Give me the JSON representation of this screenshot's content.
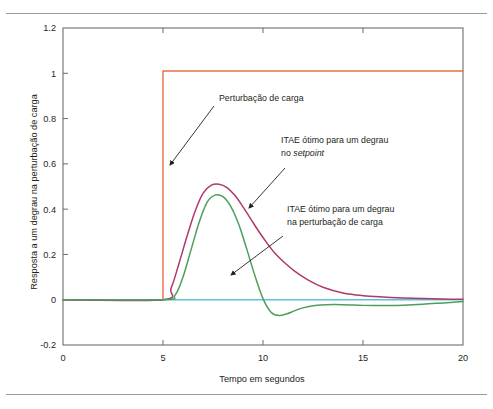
{
  "figure": {
    "clipped_header_text": "",
    "rules": [
      "top-rule",
      "bottom-rule"
    ]
  },
  "chart_data": {
    "type": "line",
    "title": "",
    "xlabel": "Tempo em segundos",
    "ylabel": "Resposta a um degrau na perturbação de carga",
    "xlim": [
      0,
      20
    ],
    "ylim": [
      -0.2,
      1.2
    ],
    "xticks": [
      0,
      5,
      10,
      15,
      20
    ],
    "xticklabels": [
      "0",
      "5",
      "10",
      "15",
      "20"
    ],
    "yticks": [
      -0.2,
      0,
      0.2,
      0.4,
      0.6,
      0.8,
      1,
      1.2
    ],
    "yticklabels": [
      "-0.2",
      "0",
      "0.2",
      "0.4",
      "0.6",
      "0.8",
      "1",
      "1.2"
    ],
    "grid": false,
    "legend": "none",
    "series": [
      {
        "name": "Perturbação de carga",
        "color": "#e8714a",
        "type": "step",
        "x": [
          0,
          5,
          5,
          20
        ],
        "y": [
          0,
          0,
          1.01,
          1.01
        ]
      },
      {
        "name": "Referência (zero)",
        "color": "#59c3d8",
        "type": "line",
        "x": [
          0,
          20
        ],
        "y": [
          0,
          0
        ]
      },
      {
        "name": "ITAE ótimo para um degrau no setpoint",
        "color": "#b0386b",
        "type": "line",
        "x": [
          0,
          5,
          5.4,
          5.8,
          6.2,
          6.6,
          7.0,
          7.4,
          7.8,
          8.2,
          8.6,
          9.0,
          9.4,
          9.8,
          10.2,
          10.6,
          11.0,
          11.6,
          12.2,
          13.0,
          14.0,
          15.0,
          16.0,
          17.0,
          18.0,
          19.0,
          20.0
        ],
        "y": [
          0,
          0,
          0.05,
          0.16,
          0.28,
          0.39,
          0.47,
          0.505,
          0.51,
          0.495,
          0.46,
          0.41,
          0.355,
          0.3,
          0.25,
          0.205,
          0.17,
          0.125,
          0.09,
          0.055,
          0.03,
          0.018,
          0.012,
          0.008,
          0.005,
          0.003,
          0.002
        ]
      },
      {
        "name": "ITAE ótimo para um degrau na perturbação de carga",
        "color": "#4e9e5c",
        "type": "line",
        "x": [
          0,
          5,
          5.6,
          6.0,
          6.4,
          6.8,
          7.2,
          7.6,
          8.0,
          8.4,
          8.8,
          9.2,
          9.6,
          10.0,
          10.4,
          10.8,
          11.2,
          11.6,
          12.0,
          12.6,
          13.2,
          14.0,
          15.0,
          16.0,
          17.0,
          18.0,
          19.0,
          20.0
        ],
        "y": [
          0,
          0,
          0.02,
          0.1,
          0.22,
          0.34,
          0.43,
          0.462,
          0.455,
          0.41,
          0.33,
          0.22,
          0.105,
          0.005,
          -0.055,
          -0.07,
          -0.062,
          -0.048,
          -0.036,
          -0.026,
          -0.022,
          -0.022,
          -0.025,
          -0.026,
          -0.024,
          -0.02,
          -0.014,
          -0.008
        ]
      }
    ],
    "annotations": [
      {
        "id": "annot-perturbacao",
        "lines": [
          "Perturbação de carga"
        ],
        "text_x": 219,
        "text_y": 101,
        "arrow": {
          "x1": 214,
          "y1": 106,
          "x2": 170,
          "y2": 165
        }
      },
      {
        "id": "annot-itae-setpoint",
        "lines": [
          "ITAE ótimo para um degrau",
          "no "
        ],
        "italic_tail": "setpoint",
        "text_x": 281,
        "text_y": 143,
        "arrow": {
          "x1": 285,
          "y1": 168,
          "x2": 249,
          "y2": 208
        }
      },
      {
        "id": "annot-itae-perturbacao",
        "lines": [
          "ITAE ótimo para um degrau",
          "na perturbação de carga"
        ],
        "text_x": 287,
        "text_y": 212,
        "arrow": {
          "x1": 283,
          "y1": 236,
          "x2": 231,
          "y2": 275
        }
      }
    ]
  }
}
